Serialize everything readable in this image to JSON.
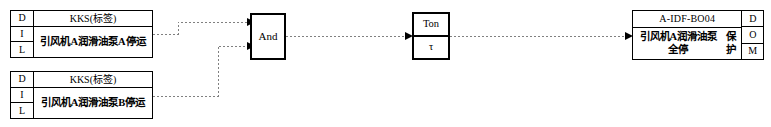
{
  "diagram": {
    "line_color": "#808080",
    "border_color": "#000000",
    "background": "#ffffff",
    "inputs": [
      {
        "dil": {
          "d": "D",
          "i": "I",
          "l": "L"
        },
        "kks_header": "KKS(标签)",
        "description": "引风机A润滑油泵A停运"
      },
      {
        "dil": {
          "d": "D",
          "i": "I",
          "l": "L"
        },
        "kks_header": "KKS(标签)",
        "description": "引风机A润滑油泵B停运"
      }
    ],
    "gate": {
      "label": "And",
      "icon": "and-gate-icon"
    },
    "timer": {
      "label": "Ton",
      "parameter": "τ",
      "icon": "on-delay-timer-icon"
    },
    "output": {
      "code": "A-IDF-BO04",
      "description_line1": "引风机A润滑油泵全停",
      "description_line2": "保护",
      "dom": {
        "d": "D",
        "o": "O",
        "m": "M"
      }
    }
  }
}
